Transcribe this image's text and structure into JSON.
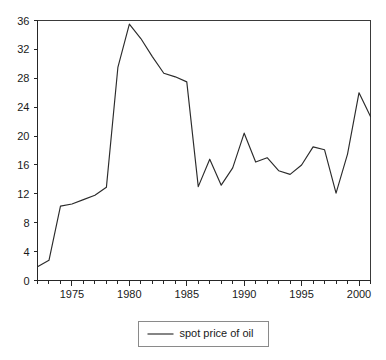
{
  "chart_data": {
    "type": "line",
    "title": "",
    "subtitle": "",
    "xlabel": "",
    "ylabel": "",
    "xlim": [
      1972,
      2001
    ],
    "ylim": [
      0,
      36
    ],
    "grid": false,
    "legend_position": "bottom-center",
    "y_ticks": [
      0,
      4,
      8,
      12,
      16,
      20,
      24,
      28,
      32,
      36
    ],
    "y_ticklabels": [
      "0",
      "4",
      "8",
      "12",
      "16",
      "20",
      "24",
      "28",
      "32",
      "36"
    ],
    "x_ticks": [
      1975,
      1980,
      1985,
      1990,
      1995,
      2000
    ],
    "x_ticklabels": [
      "1975",
      "1980",
      "1985",
      "1990",
      "1995",
      "2000"
    ],
    "x_minor_ticks": [
      1972,
      1973,
      1974,
      1975,
      1976,
      1977,
      1978,
      1979,
      1980,
      1981,
      1982,
      1983,
      1984,
      1985,
      1986,
      1987,
      1988,
      1989,
      1990,
      1991,
      1992,
      1993,
      1994,
      1995,
      1996,
      1997,
      1998,
      1999,
      2000,
      2001
    ],
    "x": [
      1972,
      1973,
      1974,
      1975,
      1976,
      1977,
      1978,
      1979,
      1980,
      1981,
      1982,
      1983,
      1984,
      1985,
      1986,
      1987,
      1988,
      1989,
      1990,
      1991,
      1992,
      1993,
      1994,
      1995,
      1996,
      1997,
      1998,
      1999,
      2000,
      2001
    ],
    "series": [
      {
        "name": "spot price of oil",
        "color": "#2b2b2b",
        "values": [
          1.9,
          2.8,
          10.3,
          10.6,
          11.2,
          11.8,
          12.9,
          29.5,
          35.5,
          33.5,
          31.0,
          28.7,
          28.2,
          27.5,
          13.0,
          16.8,
          13.2,
          15.6,
          20.4,
          16.4,
          17.0,
          15.2,
          14.7,
          16.0,
          18.5,
          18.1,
          12.1,
          17.5,
          26.0,
          22.7
        ]
      }
    ],
    "legend": [
      {
        "label": "spot price of oil",
        "color": "#2b2b2b"
      }
    ]
  },
  "colors": {
    "background": "#ffffff",
    "axis": "#262626",
    "series": "#2b2b2b",
    "legend_border": "#8a8a8a"
  }
}
